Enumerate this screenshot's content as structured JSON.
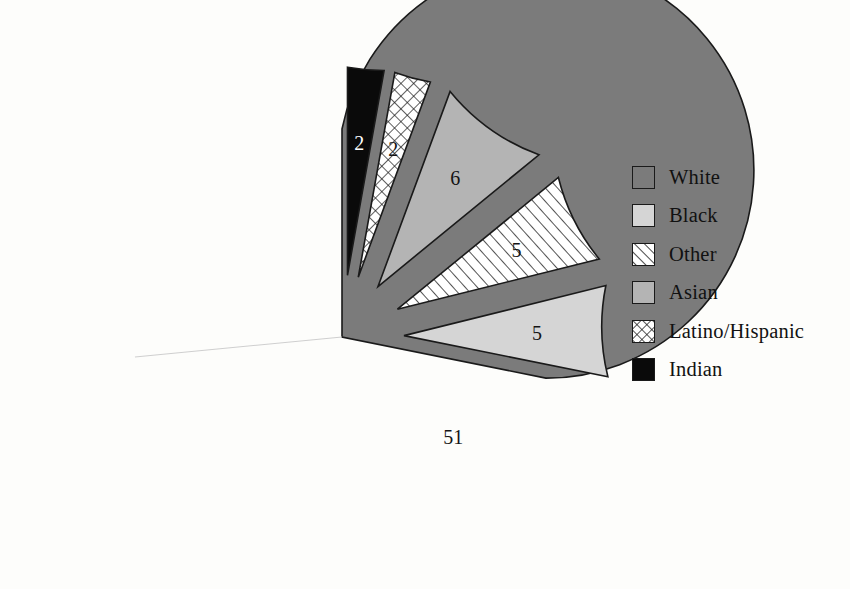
{
  "chart_data": {
    "type": "pie",
    "title": "",
    "subtitle": "",
    "xlabel": "",
    "ylabel": "",
    "legend_position": "right",
    "grid": false,
    "exploded": true,
    "value_unit": "percent",
    "categories": [
      "White",
      "Black",
      "Other",
      "Asian",
      "Latino/Hispanic",
      "Indian"
    ],
    "values": [
      51,
      5,
      5,
      6,
      2,
      2
    ],
    "labels": [
      "51",
      "5",
      "5",
      "6",
      "2",
      "2"
    ],
    "slices": [
      {
        "name": "White",
        "label": "51",
        "value": 51,
        "fill": "#7b7b7b",
        "pattern": "solid",
        "exploded": false,
        "label_color": "#141414"
      },
      {
        "name": "Black",
        "label": "5",
        "value": 5,
        "fill": "#d5d5d5",
        "pattern": "solid",
        "exploded": true,
        "label_color": "#141414"
      },
      {
        "name": "Other",
        "label": "5",
        "value": 5,
        "fill": "#ffffff",
        "pattern": "diagonal-hatch",
        "exploded": true,
        "label_color": "#141414"
      },
      {
        "name": "Asian",
        "label": "6",
        "value": 6,
        "fill": "#b4b4b4",
        "pattern": "solid",
        "exploded": true,
        "label_color": "#141414"
      },
      {
        "name": "Latino/Hispanic",
        "label": "2",
        "value": 2,
        "fill": "#ffffff",
        "pattern": "cross-hatch",
        "exploded": true,
        "label_color": "#141414"
      },
      {
        "name": "Indian",
        "label": "2",
        "value": 2,
        "fill": "#0a0a0a",
        "pattern": "solid",
        "exploded": true,
        "label_color": "#ffffff"
      }
    ]
  },
  "legend": {
    "items": [
      {
        "label": "White",
        "swatch": "solid-dark-gray",
        "color": "#7b7b7b"
      },
      {
        "label": "Black",
        "swatch": "solid-light-gray",
        "color": "#d5d5d5"
      },
      {
        "label": "Other",
        "swatch": "diagonal-hatch",
        "color": "#ffffff"
      },
      {
        "label": "Asian",
        "swatch": "solid-medium-gray",
        "color": "#b4b4b4"
      },
      {
        "label": "Latino/Hispanic",
        "swatch": "cross-hatch",
        "color": "#ffffff"
      },
      {
        "label": "Indian",
        "swatch": "solid-black",
        "color": "#0a0a0a"
      }
    ]
  },
  "colors": {
    "background": "#fdfdfb",
    "outline": "#1a1a1a",
    "text": "#111111"
  }
}
